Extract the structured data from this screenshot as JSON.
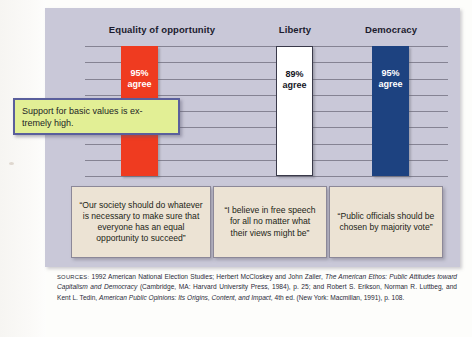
{
  "figure": {
    "background_color": "#c9c8d8",
    "gridline_count": 9
  },
  "callout": {
    "text": "Support for basic values is ex-tremely high.",
    "fill_color": "#e2ef95",
    "border_color": "#5a5f9c"
  },
  "chart_data": {
    "type": "bar",
    "title": "",
    "subtitle": "",
    "xlabel": "",
    "ylabel": "",
    "ylim": [
      0,
      100
    ],
    "grid": true,
    "legend": "none",
    "categories": [
      "Equality of opportunity",
      "Liberty",
      "Democracy"
    ],
    "values": [
      95,
      89,
      95
    ],
    "value_labels": [
      "95%",
      "89%",
      "95%"
    ],
    "value_suffix": "agree",
    "colors": [
      "#ef3b20",
      "#ffffff",
      "#1d4280"
    ],
    "bars": [
      {
        "category": "Equality of opportunity",
        "value": 95,
        "pct_label": "95%",
        "agree_label": "agree",
        "color": "#ef3b20",
        "quote": "“Our society should do whatever is necessary to make sure that everyone has an equal opportunity to succeed”"
      },
      {
        "category": "Liberty",
        "value": 89,
        "pct_label": "89%",
        "agree_label": "agree",
        "color": "#ffffff",
        "quote": "“I believe in free speech for all no matter what their views might be”"
      },
      {
        "category": "Democracy",
        "value": 95,
        "pct_label": "95%",
        "agree_label": "agree",
        "color": "#1d4280",
        "quote": "“Public officials should be chosen by majority vote”"
      }
    ]
  },
  "sources": {
    "label": "SOURCES:",
    "line1": " 1992 American National Election Studies; Herbert McCloskey and John Zaller, ",
    "italic1": "The American Ethos: Public Attitudes toward Capitalism and Democracy",
    "line2": " (Cambridge, MA: Harvard University Press, 1984), p. 25; and Robert S. Erikson, Norman R. Luttbeg, and Kent L. Tedin, ",
    "italic2": "American Public Opinions: Its Origins, Content, and Impact,",
    "line3": " 4th ed. (New York: Macmillan, 1991), p. 108."
  }
}
